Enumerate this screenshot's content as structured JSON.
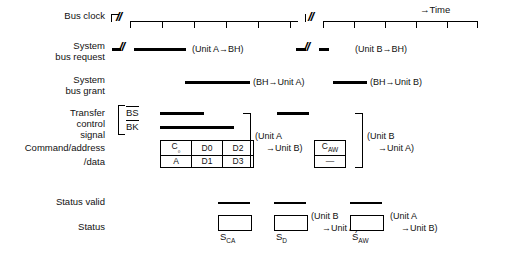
{
  "diagram": {
    "time_axis_label": "→Time",
    "rows": {
      "bus_clock": "Bus clock",
      "system_bus_request_l1": "System",
      "system_bus_request_l2": "bus request",
      "system_bus_grant_l1": "System",
      "system_bus_grant_l2": "bus grant",
      "transfer_l1": "Transfer",
      "transfer_l2": "control",
      "transfer_l3": "signal",
      "cmd_addr_l1": "Command/address",
      "cmd_addr_l2": "/data",
      "status_valid": "Status valid",
      "status": "Status"
    },
    "control_signals": {
      "bs": "BS",
      "bk": "BK"
    },
    "annotations": {
      "req_a": "(Unit A→BH)",
      "req_b": "(Unit B→BH)",
      "grant_a": "(BH→Unit A)",
      "grant_b": "(BH→Unit B)",
      "xfer_a_l1": "(Unit A",
      "xfer_a_l2": "→Unit B)",
      "xfer_b_l1": "(Unit B",
      "xfer_b_l2": "→Unit A)",
      "status_b_l1": "(Unit B",
      "status_b_l2": "→Unit A)",
      "status_a_l1": "(Unit A",
      "status_a_l2": "→Unit B)"
    },
    "break_marks": {
      "clock_left": "//",
      "clock_mid": "//",
      "request_a": "//",
      "request_b": "//"
    },
    "data_table_a": {
      "row1": [
        "C",
        "D0",
        "D2"
      ],
      "row1_sub": "₀",
      "row2": [
        "A",
        "D1",
        "D3"
      ]
    },
    "data_table_b": {
      "row1": "C",
      "row1_sub": "AW",
      "row2": "—"
    },
    "status_boxes": [
      {
        "label": "S",
        "sub": "CA"
      },
      {
        "label": "S",
        "sub": "D"
      },
      {
        "label": "S",
        "sub": "AW"
      }
    ],
    "colors": {
      "ink": "#000000",
      "background": "#ffffff"
    }
  }
}
